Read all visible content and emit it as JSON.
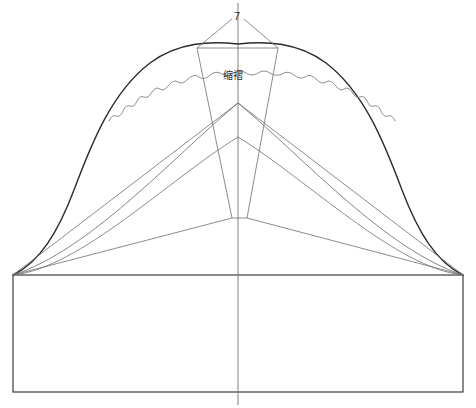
{
  "drawing": {
    "title": "袖山缩褶制图",
    "type": "sewing-pattern-draft",
    "canvas": {
      "width": 476,
      "height": 408
    },
    "colors": {
      "outline_dark": "#2b2b2b",
      "construction_line": "#6e6e6e",
      "wave_line": "#8a8a8a",
      "background": "#ffffff"
    },
    "labels": [
      {
        "id": "seven",
        "text": "7",
        "x": 234,
        "y": 11,
        "role": "measurement-callout",
        "leader_lines": 2
      },
      {
        "id": "gather",
        "text": "缩褶",
        "x": 223,
        "y": 71,
        "role": "region-annotation"
      }
    ],
    "geometry": {
      "base_rectangle": {
        "left": 13,
        "top": 275,
        "right": 463,
        "bottom": 392
      },
      "center_line_x": 238,
      "center_line_top": 3,
      "center_line_bottom": 405,
      "apex": {
        "x": 238,
        "y": 44
      },
      "convergence_point": {
        "x": 238,
        "y": 103
      },
      "left_corner": {
        "x": 13,
        "y": 275
      },
      "right_corner": {
        "x": 463,
        "y": 275
      },
      "wedge_top_left": {
        "x": 197,
        "y": 48
      },
      "wedge_top_right": {
        "x": 278,
        "y": 48
      },
      "wedge_bottom_left": {
        "x": 232,
        "y": 218
      },
      "wedge_bottom_right": {
        "x": 247,
        "y": 218
      },
      "wave_left_end": {
        "x": 109,
        "y": 121
      },
      "wave_right_end": {
        "x": 366,
        "y": 121
      },
      "leader_left_start": {
        "x": 232,
        "y": 19
      },
      "leader_left_end": {
        "x": 197,
        "y": 48
      },
      "leader_right_start": {
        "x": 244,
        "y": 19
      },
      "leader_right_end": {
        "x": 278,
        "y": 48
      }
    }
  }
}
